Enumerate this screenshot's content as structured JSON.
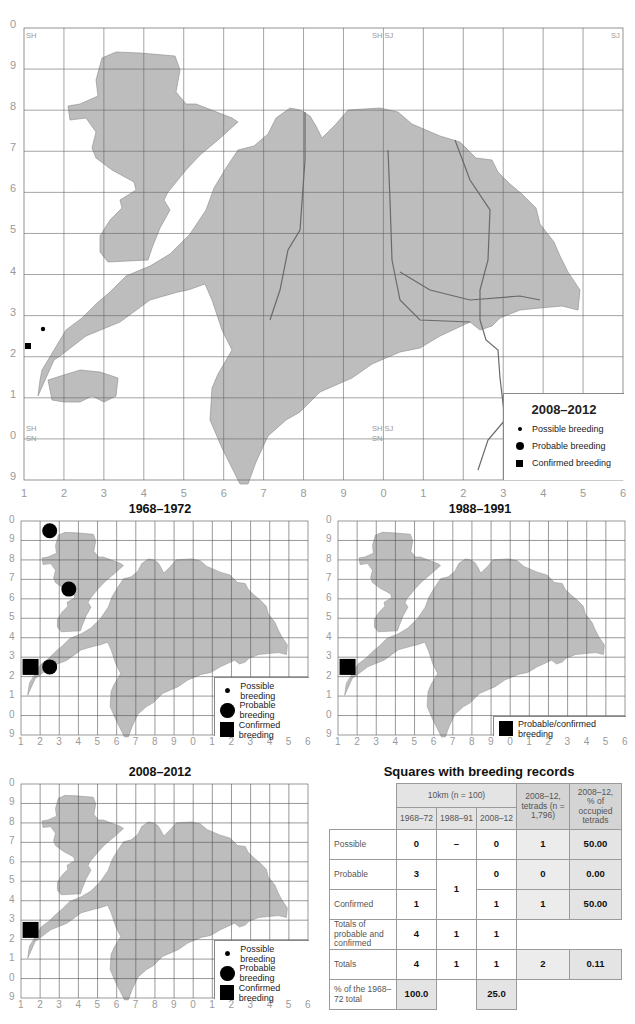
{
  "main_map": {
    "legend": {
      "title": "2008–2012",
      "items": [
        {
          "symbol": "small-dot",
          "label": "Possible breeding"
        },
        {
          "symbol": "large-dot",
          "label": "Probable breeding"
        },
        {
          "symbol": "square",
          "label": "Confirmed breeding"
        }
      ]
    },
    "y_ticks": [
      "0",
      "9",
      "8",
      "7",
      "6",
      "5",
      "4",
      "3",
      "2",
      "1",
      "0",
      "9"
    ],
    "x_ticks": [
      "1",
      "2",
      "3",
      "4",
      "5",
      "6",
      "7",
      "8",
      "9",
      "0",
      "1",
      "2",
      "3",
      "4",
      "5",
      "6"
    ],
    "grid_square_labels": {
      "top_left": "SH",
      "top_mid": "SH SJ",
      "top_right": "SJ",
      "bottom_left_upper": "SH",
      "bottom_left_lower": "SN",
      "bottom_mid_upper": "SH SJ",
      "bottom_mid_lower": "SN"
    },
    "records": [
      {
        "type": "possible",
        "x_cell": 1.6,
        "y_cell": 7.55
      },
      {
        "type": "confirmed",
        "x_cell": 0.1,
        "y_cell": 7.8
      }
    ]
  },
  "small_maps": [
    {
      "title": "1968–1972",
      "legend": [
        {
          "symbol": "small-dot",
          "label": "Possible breeding"
        },
        {
          "symbol": "large-dot",
          "label": "Probable breeding"
        },
        {
          "symbol": "square",
          "label": "Confirmed breeding"
        }
      ],
      "records": [
        {
          "type": "probable",
          "col": 1,
          "row": 0
        },
        {
          "type": "probable",
          "col": 2,
          "row": 3
        },
        {
          "type": "probable",
          "col": 1,
          "row": 7
        },
        {
          "type": "confirmed",
          "col": 0,
          "row": 7
        }
      ]
    },
    {
      "title": "1988–1991",
      "legend": [
        {
          "symbol": "square",
          "label": "Probable/confirmed breeding"
        }
      ],
      "records": [
        {
          "type": "confirmed",
          "col": 0,
          "row": 7
        }
      ]
    },
    {
      "title": "2008–2012",
      "legend": [
        {
          "symbol": "small-dot",
          "label": "Possible breeding"
        },
        {
          "symbol": "large-dot",
          "label": "Probable breeding"
        },
        {
          "symbol": "square",
          "label": "Confirmed breeding"
        }
      ],
      "records": [
        {
          "type": "confirmed",
          "col": 0,
          "row": 7
        }
      ]
    }
  ],
  "small_y_ticks": [
    "0",
    "9",
    "8",
    "7",
    "6",
    "5",
    "4",
    "3",
    "2",
    "1",
    "0",
    "9"
  ],
  "small_x_ticks": [
    "1",
    "2",
    "3",
    "4",
    "5",
    "6",
    "7",
    "8",
    "9",
    "0",
    "1",
    "2",
    "3",
    "4",
    "5",
    "6"
  ],
  "table": {
    "title": "Squares with breeding records",
    "group_header": "10km (n = 100)",
    "col_headers": [
      "1968–72",
      "1988–91",
      "2008–12"
    ],
    "tetrad_header": "2008–12, tetrads (n = 1,796)",
    "pct_header": "2008–12, % of occupied tetrads",
    "rows": {
      "possible": {
        "label": "Possible",
        "c1": "0",
        "c2": "–",
        "c3": "0",
        "tetrads": "1",
        "pct": "50.00"
      },
      "probable": {
        "label": "Probable",
        "c1": "3",
        "c3": "0",
        "tetrads": "0",
        "pct": "0.00"
      },
      "confirmed": {
        "label": "Confirmed",
        "c1": "1",
        "c3": "1",
        "tetrads": "1",
        "pct": "50.00"
      },
      "prob_conf_merged_1988": "1",
      "totals_pc": {
        "label": "Totals of probable and confirmed",
        "c1": "4",
        "c2": "1",
        "c3": "1"
      },
      "totals": {
        "label": "Totals",
        "c1": "4",
        "c2": "1",
        "c3": "1",
        "tetrads": "2",
        "pct": "0.11"
      },
      "pct_total": {
        "label": "% of the 1968–72 total",
        "c1": "100.0",
        "c3": "25.0"
      }
    }
  },
  "colors": {
    "land": "#b8b8b8",
    "land_light": "#d0d0d0",
    "grid": "#555555",
    "axis_text": "#9a9a9a",
    "symbol": "#000000"
  }
}
